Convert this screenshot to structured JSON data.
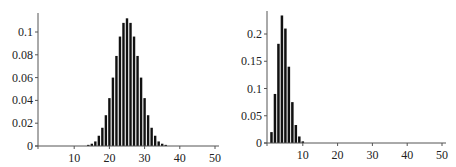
{
  "chart_data": [
    {
      "type": "bar",
      "title": "",
      "xlabel": "",
      "ylabel": "",
      "xlim": [
        0,
        50
      ],
      "ylim": [
        0,
        0.118
      ],
      "grid": false,
      "x_ticks": [
        10,
        20,
        30,
        40,
        50
      ],
      "y_ticks": [
        "0",
        "0.02",
        "0.04",
        "0.06",
        "0.08",
        "0.1"
      ],
      "y_tick_values": [
        0,
        0.02,
        0.04,
        0.06,
        0.08,
        0.1
      ],
      "x": [
        14,
        15,
        16,
        17,
        18,
        19,
        20,
        21,
        22,
        23,
        24,
        25,
        26,
        27,
        28,
        29,
        30,
        31,
        32,
        33,
        34,
        35,
        36
      ],
      "values": [
        0.001,
        0.002,
        0.004,
        0.009,
        0.016,
        0.027,
        0.042,
        0.06,
        0.079,
        0.096,
        0.108,
        0.112,
        0.108,
        0.096,
        0.079,
        0.06,
        0.042,
        0.027,
        0.016,
        0.009,
        0.004,
        0.002,
        0.001
      ]
    },
    {
      "type": "bar",
      "title": "",
      "xlabel": "",
      "ylabel": "",
      "xlim": [
        0,
        50
      ],
      "ylim": [
        0,
        0.245
      ],
      "grid": false,
      "x_ticks": [
        10,
        20,
        30,
        40,
        50
      ],
      "y_ticks": [
        "0",
        "0.05",
        "0.1",
        "0.15",
        "0.2"
      ],
      "y_tick_values": [
        0,
        0.05,
        0.1,
        0.15,
        0.2
      ],
      "x": [
        1,
        2,
        3,
        4,
        5,
        6,
        7,
        8,
        9,
        10
      ],
      "values": [
        0.02,
        0.09,
        0.182,
        0.234,
        0.21,
        0.14,
        0.075,
        0.033,
        0.012,
        0.003
      ]
    }
  ]
}
